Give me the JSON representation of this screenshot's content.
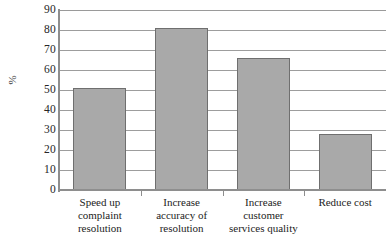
{
  "chart_data": {
    "type": "bar",
    "title": "",
    "xlabel": "",
    "ylabel": "%",
    "categories": [
      "Speed up complaint resolution",
      "Increase accuracy of resolution",
      "Increase customer services quality",
      "Reduce cost"
    ],
    "category_lines": [
      [
        "Speed up",
        "complaint",
        "resolution"
      ],
      [
        "Increase",
        "accuracy of",
        "resolution"
      ],
      [
        "Increase",
        "customer",
        "services quality"
      ],
      [
        "Reduce cost"
      ]
    ],
    "values": [
      51,
      81,
      66,
      28
    ],
    "ylim": [
      0,
      90
    ],
    "ytick_step": 10,
    "yticks": [
      "90",
      "80",
      "70",
      "60",
      "50",
      "40",
      "30",
      "20",
      "10",
      "0"
    ],
    "ytick_values": [
      90,
      80,
      70,
      60,
      50,
      40,
      30,
      20,
      10,
      0
    ],
    "grid": true,
    "legend": false,
    "legend_position": "none",
    "colors": {
      "bar_fill": "#a9a9a9",
      "bar_border": "#6f6f6f",
      "gridline": "#9d9d9d",
      "axis": "#8e8e8e",
      "text": "#232323",
      "background": "#ffffff"
    }
  }
}
